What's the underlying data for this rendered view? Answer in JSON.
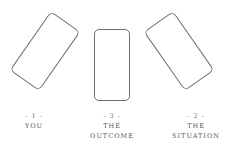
{
  "positions": [
    {
      "number": "- 1 -",
      "lines": [
        "YOU"
      ]
    },
    {
      "number": "- 3 -",
      "lines": [
        "THE",
        "OUTCOME"
      ]
    },
    {
      "number": "- 2 -",
      "lines": [
        "THE",
        "SITUATION"
      ]
    }
  ],
  "colors": {
    "card_stroke": "#6f6f6f",
    "text": "#555555"
  }
}
